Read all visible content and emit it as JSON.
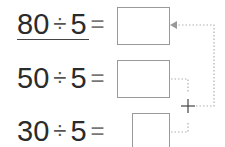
{
  "problems": [
    {
      "dividend": "80",
      "operator": "÷",
      "divisor": "5",
      "equals": "=",
      "answer": ""
    },
    {
      "dividend": "50",
      "operator": "÷",
      "divisor": "5",
      "equals": "=",
      "answer": ""
    },
    {
      "dividend": "30",
      "operator": "÷",
      "divisor": "5",
      "equals": "=",
      "answer": ""
    }
  ],
  "connector": {
    "symbol": "+",
    "line_color": "#b0b0b0",
    "arrow_color": "#999999"
  }
}
